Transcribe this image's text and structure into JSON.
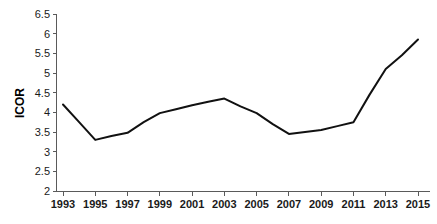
{
  "chart_data": {
    "type": "line",
    "title": "",
    "xlabel": "",
    "ylabel": "ICOR",
    "ylim": [
      2,
      6.5
    ],
    "xlim": [
      1993,
      2015
    ],
    "grid": false,
    "legend": false,
    "y_ticks": [
      "2",
      "2.5",
      "3",
      "3.5",
      "4",
      "4.5",
      "5",
      "5.5",
      "6",
      "6.5"
    ],
    "y_tick_values": [
      2,
      2.5,
      3,
      3.5,
      4,
      4.5,
      5,
      5.5,
      6,
      6.5
    ],
    "x_ticks": [
      "1993",
      "1995",
      "1997",
      "1999",
      "2001",
      "2003",
      "2005",
      "2007",
      "2009",
      "2011",
      "2013",
      "2015"
    ],
    "x": [
      1993,
      1994,
      1995,
      1996,
      1997,
      1998,
      1999,
      2000,
      2001,
      2002,
      2003,
      2004,
      2005,
      2006,
      2007,
      2008,
      2009,
      2010,
      2011,
      2012,
      2013,
      2014,
      2015
    ],
    "series": [
      {
        "name": "ICOR",
        "color": "#111111",
        "values": [
          4.2,
          3.75,
          3.3,
          3.4,
          3.48,
          3.75,
          3.98,
          4.08,
          4.18,
          4.27,
          4.35,
          4.15,
          3.98,
          3.7,
          3.45,
          3.5,
          3.55,
          3.65,
          3.75,
          4.45,
          5.1,
          5.45,
          5.85
        ]
      }
    ]
  },
  "axis": {
    "y_label": "ICOR"
  }
}
